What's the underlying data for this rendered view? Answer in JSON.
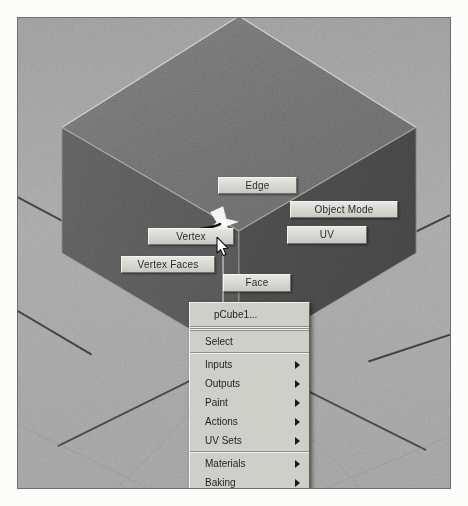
{
  "app": {
    "title": "Maya viewport marking menu",
    "viewport": {
      "object_name": "pCube1",
      "background_color": "#a3a3a3",
      "cube_top_face_color": "#707070",
      "cube_left_face_color": "#5a5a5a",
      "cube_right_face_color": "#4a4a4a",
      "grid_line_color": "#2b2b2b",
      "border_color": "#6d6d6d"
    }
  },
  "marking_menu": {
    "items": [
      {
        "id": "edge",
        "label": "Edge",
        "position": "north"
      },
      {
        "id": "object-mode",
        "label": "Object Mode",
        "position": "north-east"
      },
      {
        "id": "uv",
        "label": "UV",
        "position": "east"
      },
      {
        "id": "vertex",
        "label": "Vertex",
        "position": "west"
      },
      {
        "id": "vertex-faces",
        "label": "Vertex Faces",
        "position": "south-west"
      },
      {
        "id": "face",
        "label": "Face",
        "position": "south"
      }
    ]
  },
  "context_menu": {
    "header": "pCube1...",
    "items": [
      {
        "label": "Select",
        "submenu": false
      },
      {
        "label": "Inputs",
        "submenu": true
      },
      {
        "label": "Outputs",
        "submenu": true
      },
      {
        "label": "Paint",
        "submenu": true
      },
      {
        "label": "Actions",
        "submenu": true
      },
      {
        "label": "UV Sets",
        "submenu": true
      },
      {
        "label": "Materials",
        "submenu": true
      },
      {
        "label": "Baking",
        "submenu": true
      }
    ]
  },
  "cursor": {
    "type": "arrow-pointer"
  },
  "hotspot": {
    "type": "marking-menu-origin-star"
  }
}
